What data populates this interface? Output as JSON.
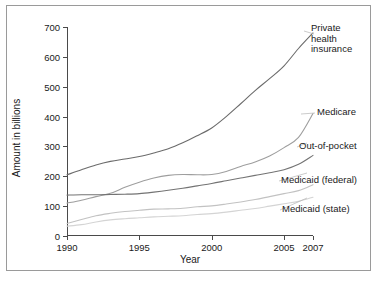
{
  "chart_data": {
    "type": "line",
    "title": "",
    "xlabel": "Year",
    "ylabel": "Amount in billions",
    "xlim": [
      1990,
      2007
    ],
    "ylim": [
      0,
      700
    ],
    "xticks": [
      1990,
      1995,
      2000,
      2005,
      2007
    ],
    "yticks": [
      0,
      100,
      200,
      300,
      400,
      500,
      600,
      700
    ],
    "grid": false,
    "legend_position": "right-inline-annotations",
    "x": [
      1990,
      1991,
      1992,
      1993,
      1994,
      1995,
      1996,
      1997,
      1998,
      1999,
      2000,
      2001,
      2002,
      2003,
      2004,
      2005,
      2006,
      2007
    ],
    "series": [
      {
        "name": "Private health insurance",
        "color": "#6b6b6b",
        "values": [
          205,
          222,
          238,
          250,
          258,
          266,
          278,
          292,
          312,
          336,
          362,
          400,
          443,
          487,
          527,
          570,
          628,
          680
        ]
      },
      {
        "name": "Medicare",
        "color": "#9e9e9e",
        "values": [
          110,
          120,
          132,
          143,
          163,
          180,
          194,
          203,
          206,
          205,
          206,
          216,
          233,
          248,
          268,
          296,
          330,
          410
        ]
      },
      {
        "name": "Out-of-pocket",
        "color": "#737373",
        "values": [
          137,
          138,
          138,
          139,
          140,
          142,
          147,
          153,
          160,
          168,
          176,
          185,
          194,
          203,
          212,
          222,
          240,
          270
        ]
      },
      {
        "name": "Medicaid (federal)",
        "color": "#c2c2c2",
        "values": [
          42,
          55,
          68,
          76,
          82,
          86,
          90,
          91,
          93,
          98,
          101,
          107,
          114,
          122,
          132,
          142,
          152,
          172
        ]
      },
      {
        "name": "Medicaid (state)",
        "color": "#d4d4d4",
        "values": [
          33,
          38,
          47,
          54,
          58,
          61,
          64,
          66,
          68,
          72,
          75,
          80,
          86,
          92,
          100,
          108,
          116,
          130
        ]
      }
    ],
    "annotations": [
      {
        "text": "Private\nhealth\ninsurance",
        "x": 310,
        "y": 22
      },
      {
        "text": "Medicare",
        "x": 316,
        "y": 106
      },
      {
        "text": "Out-of-pocket",
        "x": 298,
        "y": 140
      },
      {
        "text": "Medicaid (federal)",
        "x": 280,
        "y": 174
      },
      {
        "text": "Medicaid (state)",
        "x": 281,
        "y": 203
      }
    ]
  }
}
